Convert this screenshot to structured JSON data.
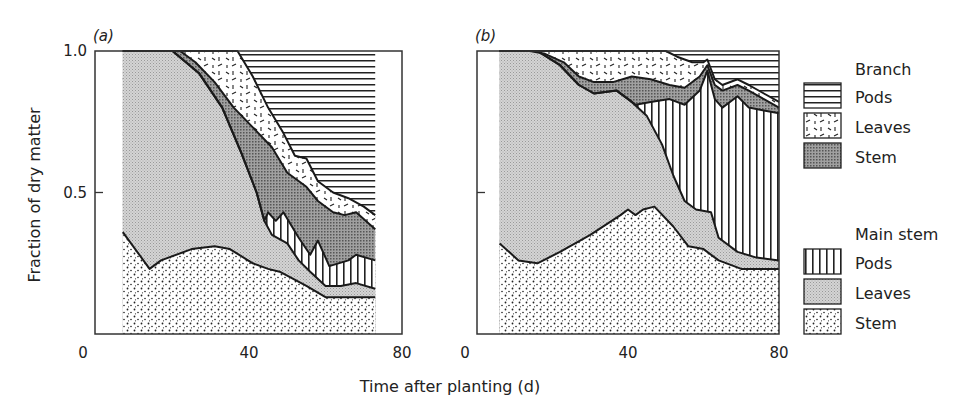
{
  "chart_data": {
    "type": "area",
    "stacked": true,
    "ylabel": "Fraction of dry matter",
    "xlabel": "Time after planting (d)",
    "xlim": [
      0,
      80
    ],
    "ylim": [
      0,
      1.0
    ],
    "xticks": [
      "0",
      "40",
      "80"
    ],
    "yticks": [
      "0.5",
      "1.0"
    ],
    "legend": {
      "placement": "right",
      "groups": [
        {
          "title": "Branch",
          "entries": [
            {
              "name": "Pods",
              "pattern": "horizontal-lines"
            },
            {
              "name": "Leaves",
              "pattern": "dashes"
            },
            {
              "name": "Stem",
              "pattern": "dark-gray"
            }
          ]
        },
        {
          "title": "Main stem",
          "entries": [
            {
              "name": "Pods",
              "pattern": "vertical-lines"
            },
            {
              "name": "Leaves",
              "pattern": "light-gray"
            },
            {
              "name": "Stem",
              "pattern": "dots"
            }
          ]
        }
      ]
    },
    "panels": [
      {
        "label": "(a)",
        "x_start": 7,
        "x_end": 73,
        "boundaries_note": "cumulative upper boundaries of each stacked layer (fraction)",
        "main_stem_top": [
          [
            7,
            0.36
          ],
          [
            14,
            0.23
          ],
          [
            17,
            0.26
          ],
          [
            25,
            0.3
          ],
          [
            31,
            0.31
          ],
          [
            35,
            0.3
          ],
          [
            41,
            0.25
          ],
          [
            45,
            0.23
          ],
          [
            48,
            0.22
          ],
          [
            55,
            0.17
          ],
          [
            60,
            0.13
          ],
          [
            73,
            0.13
          ]
        ],
        "main_leaves_top": [
          [
            7,
            1.0
          ],
          [
            20,
            1.0
          ],
          [
            27,
            0.92
          ],
          [
            33,
            0.8
          ],
          [
            38,
            0.64
          ],
          [
            42,
            0.5
          ],
          [
            44,
            0.4
          ],
          [
            46,
            0.35
          ],
          [
            50,
            0.32
          ],
          [
            53,
            0.26
          ],
          [
            56,
            0.22
          ],
          [
            60,
            0.17
          ],
          [
            64,
            0.17
          ],
          [
            68,
            0.18
          ],
          [
            73,
            0.16
          ]
        ],
        "main_pods_top": [
          [
            7,
            1.0
          ],
          [
            20,
            1.0
          ],
          [
            27,
            0.92
          ],
          [
            33,
            0.8
          ],
          [
            38,
            0.64
          ],
          [
            42,
            0.5
          ],
          [
            44,
            0.4
          ],
          [
            45,
            0.43
          ],
          [
            47,
            0.4
          ],
          [
            49,
            0.43
          ],
          [
            53,
            0.34
          ],
          [
            56,
            0.28
          ],
          [
            58,
            0.33
          ],
          [
            61,
            0.24
          ],
          [
            66,
            0.26
          ],
          [
            68,
            0.28
          ],
          [
            73,
            0.26
          ]
        ],
        "branch_stem_top": [
          [
            7,
            1.0
          ],
          [
            22,
            1.0
          ],
          [
            26,
            0.96
          ],
          [
            31,
            0.89
          ],
          [
            36,
            0.8
          ],
          [
            41,
            0.73
          ],
          [
            46,
            0.66
          ],
          [
            50,
            0.57
          ],
          [
            55,
            0.52
          ],
          [
            58,
            0.47
          ],
          [
            62,
            0.43
          ],
          [
            65,
            0.42
          ],
          [
            68,
            0.43
          ],
          [
            73,
            0.37
          ]
        ],
        "branch_leaves_top": [
          [
            7,
            1.0
          ],
          [
            37,
            1.0
          ],
          [
            41,
            0.91
          ],
          [
            45,
            0.8
          ],
          [
            49,
            0.71
          ],
          [
            52,
            0.63
          ],
          [
            55,
            0.62
          ],
          [
            58,
            0.54
          ],
          [
            62,
            0.5
          ],
          [
            66,
            0.48
          ],
          [
            70,
            0.45
          ],
          [
            73,
            0.42
          ]
        ],
        "branch_pods_top": [
          [
            7,
            1.0
          ],
          [
            73,
            1.0
          ]
        ]
      },
      {
        "label": "(b)",
        "x_start": 6,
        "x_end": 80,
        "main_stem_top": [
          [
            6,
            0.32
          ],
          [
            11,
            0.26
          ],
          [
            16,
            0.25
          ],
          [
            22,
            0.29
          ],
          [
            30,
            0.35
          ],
          [
            38,
            0.42
          ],
          [
            40,
            0.44
          ],
          [
            42,
            0.42
          ],
          [
            44,
            0.44
          ],
          [
            47,
            0.45
          ],
          [
            52,
            0.38
          ],
          [
            56,
            0.31
          ],
          [
            60,
            0.3
          ],
          [
            64,
            0.26
          ],
          [
            70,
            0.23
          ],
          [
            80,
            0.23
          ]
        ],
        "main_leaves_top": [
          [
            6,
            1.0
          ],
          [
            16,
            1.0
          ],
          [
            22,
            0.95
          ],
          [
            27,
            0.88
          ],
          [
            31,
            0.85
          ],
          [
            37,
            0.86
          ],
          [
            41,
            0.82
          ],
          [
            45,
            0.77
          ],
          [
            49,
            0.67
          ],
          [
            52,
            0.56
          ],
          [
            55,
            0.47
          ],
          [
            58,
            0.44
          ],
          [
            62,
            0.43
          ],
          [
            64,
            0.34
          ],
          [
            69,
            0.29
          ],
          [
            74,
            0.27
          ],
          [
            80,
            0.26
          ]
        ],
        "main_pods_top": [
          [
            6,
            1.0
          ],
          [
            16,
            1.0
          ],
          [
            22,
            0.95
          ],
          [
            27,
            0.88
          ],
          [
            31,
            0.85
          ],
          [
            37,
            0.86
          ],
          [
            41,
            0.82
          ],
          [
            42,
            0.81
          ],
          [
            46,
            0.82
          ],
          [
            51,
            0.83
          ],
          [
            55,
            0.81
          ],
          [
            59,
            0.86
          ],
          [
            61,
            0.93
          ],
          [
            63,
            0.83
          ],
          [
            65,
            0.8
          ],
          [
            69,
            0.84
          ],
          [
            72,
            0.8
          ],
          [
            76,
            0.79
          ],
          [
            80,
            0.78
          ]
        ],
        "branch_stem_top": [
          [
            6,
            1.0
          ],
          [
            14,
            1.0
          ],
          [
            18,
            0.99
          ],
          [
            23,
            0.96
          ],
          [
            27,
            0.91
          ],
          [
            31,
            0.89
          ],
          [
            36,
            0.89
          ],
          [
            41,
            0.91
          ],
          [
            46,
            0.9
          ],
          [
            51,
            0.88
          ],
          [
            55,
            0.87
          ],
          [
            59,
            0.91
          ],
          [
            61,
            0.95
          ],
          [
            63,
            0.88
          ],
          [
            65,
            0.86
          ],
          [
            69,
            0.88
          ],
          [
            72,
            0.86
          ],
          [
            76,
            0.83
          ],
          [
            80,
            0.8
          ]
        ],
        "branch_leaves_top": [
          [
            6,
            1.0
          ],
          [
            50,
            1.0
          ],
          [
            53,
            0.98
          ],
          [
            57,
            0.96
          ],
          [
            60,
            0.96
          ],
          [
            61,
            0.97
          ],
          [
            63,
            0.9
          ],
          [
            65,
            0.88
          ],
          [
            69,
            0.9
          ],
          [
            72,
            0.88
          ],
          [
            76,
            0.85
          ],
          [
            80,
            0.82
          ]
        ],
        "branch_pods_top": [
          [
            6,
            1.0
          ],
          [
            80,
            1.0
          ]
        ]
      }
    ]
  }
}
